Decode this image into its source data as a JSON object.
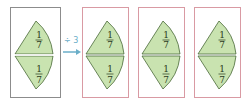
{
  "diagram": {
    "source": {
      "top_fraction": {
        "num": "1",
        "den": "7"
      },
      "bottom_fraction": {
        "num": "1",
        "den": "7"
      }
    },
    "operation_label": "÷ 3",
    "results": [
      {
        "top_fraction": {
          "num": "1",
          "den": "7"
        },
        "bottom_fraction": {
          "num": "1",
          "den": "7"
        }
      },
      {
        "top_fraction": {
          "num": "1",
          "den": "7"
        },
        "bottom_fraction": {
          "num": "1",
          "den": "7"
        }
      },
      {
        "top_fraction": {
          "num": "1",
          "den": "7"
        },
        "bottom_fraction": {
          "num": "1",
          "den": "7"
        }
      }
    ],
    "colors": {
      "sector_fill": "#c9e3b0",
      "sector_stroke": "#4a6a3a",
      "source_border": "#8c8c8c",
      "result_border": "#d99aa3",
      "arrow": "#6aaec8"
    }
  }
}
